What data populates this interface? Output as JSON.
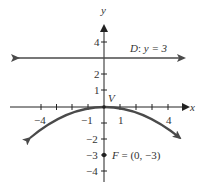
{
  "figure": {
    "type": "parabola-focus-directrix",
    "axes": {
      "x_label": "x",
      "y_label": "y",
      "x_tick_labels": [
        "−4",
        "−1",
        "1",
        "4"
      ],
      "y_tick_labels": [
        "4",
        "2",
        "1",
        "−2",
        "−3",
        "−4"
      ],
      "x_range": [
        -5,
        5
      ],
      "y_range": [
        -5,
        5
      ]
    },
    "directrix": {
      "label": "D: y = 3",
      "name": "D",
      "equation": "y = 3",
      "y": 3
    },
    "focus": {
      "label": "F = (0, −3)",
      "name": "F",
      "coords": "(0, −3)",
      "x": 0,
      "y": -3
    },
    "vertex": {
      "label": "V",
      "x": 0,
      "y": 0
    },
    "parabola": {
      "equation": "x^2 = -12y",
      "opens": "down"
    },
    "colors": {
      "line": "#4a4a4a",
      "axis": "#222222"
    }
  }
}
